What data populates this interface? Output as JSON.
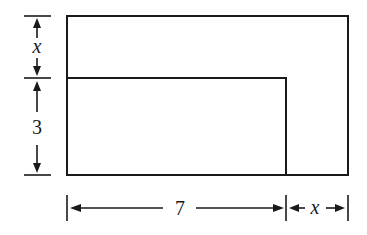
{
  "diagram": {
    "type": "geometry-figure",
    "colors": {
      "stroke": "#1a1a1a",
      "background": "#ffffff"
    },
    "outer_rectangle": {
      "width_expr": "7 + x",
      "height_expr": "3 + x"
    },
    "inner_rectangle": {
      "width": "7",
      "height": "3"
    },
    "labels": {
      "left_top": "x",
      "left_bottom": "3",
      "bottom_left": "7",
      "bottom_right": "x"
    }
  }
}
